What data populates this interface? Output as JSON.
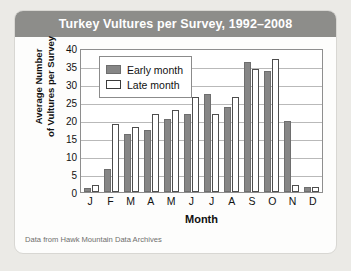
{
  "chart_data": {
    "type": "bar",
    "title": "Turkey Vultures per Survey, 1992–2008",
    "xlabel": "Month",
    "ylabel": "Average Number of Vultures per Survey",
    "ylabel_line1": "Average Number",
    "ylabel_line2": "of Vultures per Survey",
    "ylim": [
      0,
      40
    ],
    "ytick_step": 5,
    "yticks": [
      0,
      5,
      10,
      15,
      20,
      25,
      30,
      35,
      40
    ],
    "ytick_labels": [
      "0",
      "5",
      "10",
      "15",
      "20",
      "25",
      "30",
      "35",
      "40"
    ],
    "grid": true,
    "grid_axis": "y",
    "legend_position": "upper left",
    "categories": [
      "J",
      "F",
      "M",
      "A",
      "M",
      "J",
      "J",
      "A",
      "S",
      "O",
      "N",
      "D"
    ],
    "category_names": [
      "January",
      "February",
      "March",
      "April",
      "May",
      "June",
      "July",
      "August",
      "September",
      "October",
      "November",
      "December"
    ],
    "series": [
      {
        "name": "Early month",
        "color": "#868686",
        "values": [
          1.0,
          6.5,
          16.0,
          17.3,
          20.2,
          21.6,
          27.2,
          23.7,
          36.0,
          33.5,
          19.6,
          1.5
        ]
      },
      {
        "name": "Late month",
        "color": "#ffffff",
        "values": [
          2.0,
          18.8,
          18.1,
          21.8,
          22.9,
          26.3,
          21.8,
          26.5,
          34.1,
          36.9,
          2.0,
          1.5
        ]
      }
    ],
    "source_note": "Data from Hawk Mountain Data Archives"
  },
  "figure": {
    "title": "Turkey Vultures per Survey, 1992–2008",
    "title_bar_color": "#8d8d8a",
    "card_background": "#fdfdfc",
    "page_background": "#ebeae6",
    "axis_color": "#8e8e8e",
    "gridline_color": "#b9b9b9"
  }
}
